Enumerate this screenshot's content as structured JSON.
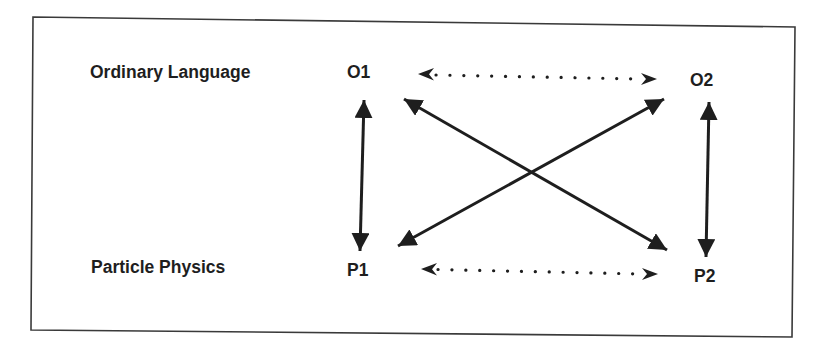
{
  "diagram": {
    "frame": {
      "stroke": "#3a3a3a"
    },
    "colors": {
      "ink": "#1e1e1e"
    },
    "row_labels": [
      {
        "id": "ordinary-language",
        "text": "Ordinary Language",
        "x": 90,
        "y": 64
      },
      {
        "id": "particle-physics",
        "text": "Particle Physics",
        "x": 91,
        "y": 259
      }
    ],
    "nodes": [
      {
        "id": "O1",
        "text": "O1",
        "x": 347,
        "y": 63
      },
      {
        "id": "O2",
        "text": "O2",
        "x": 690,
        "y": 72
      },
      {
        "id": "P1",
        "text": "P1",
        "x": 347,
        "y": 261
      },
      {
        "id": "P2",
        "text": "P2",
        "x": 694,
        "y": 268
      }
    ],
    "edges": [
      {
        "from": "O1",
        "to": "P1",
        "style": "solid",
        "direction": "both"
      },
      {
        "from": "O2",
        "to": "P2",
        "style": "solid",
        "direction": "both"
      },
      {
        "from": "O1",
        "to": "P2",
        "style": "solid",
        "direction": "both"
      },
      {
        "from": "O2",
        "to": "P1",
        "style": "solid",
        "direction": "both"
      },
      {
        "from": "O1",
        "to": "O2",
        "style": "dotted",
        "direction": "both"
      },
      {
        "from": "P1",
        "to": "P2",
        "style": "dotted",
        "direction": "both"
      }
    ]
  }
}
